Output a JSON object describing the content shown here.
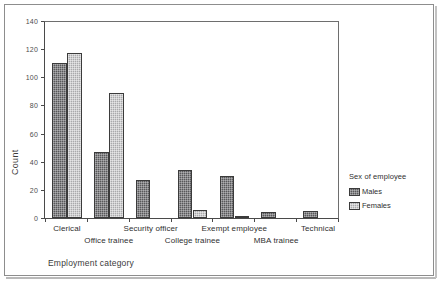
{
  "chart_data": {
    "type": "bar",
    "title": "",
    "xlabel": "Employment category",
    "ylabel": "Count",
    "ylim": [
      0,
      140
    ],
    "yticks": [
      0,
      20,
      40,
      60,
      80,
      100,
      120,
      140
    ],
    "grid": false,
    "legend_position": "right",
    "legend_title": "Sex of employee",
    "categories": [
      "Clerical",
      "Office trainee",
      "Security officer",
      "College trainee",
      "Exempt employee",
      "MBA trainee",
      "Technical"
    ],
    "series": [
      {
        "name": "Males",
        "color": "#58585a",
        "values": [
          110,
          47,
          27,
          34,
          30,
          4,
          5
        ]
      },
      {
        "name": "Females",
        "color": "#a9a9ab",
        "values": [
          117,
          89,
          0,
          6,
          1,
          0,
          0
        ]
      }
    ]
  }
}
